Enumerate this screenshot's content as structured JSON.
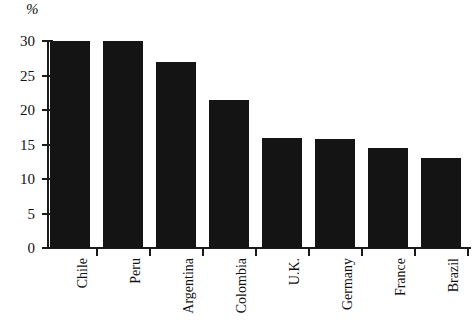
{
  "chart_data": {
    "type": "bar",
    "title": "",
    "subtitle": "",
    "xlabel": "",
    "ylabel": "%",
    "unit_label": "%",
    "categories": [
      "Chile",
      "Peru",
      "Argentina",
      "Colombia",
      "U.K.",
      "Germany",
      "France",
      "Brazil"
    ],
    "values": [
      30,
      30,
      27,
      21.5,
      16,
      15.8,
      14.5,
      13
    ],
    "series": [
      {
        "name": "",
        "values": [
          30,
          30,
          27,
          21.5,
          16,
          15.8,
          14.5,
          13
        ]
      }
    ],
    "ylim": [
      0,
      30
    ],
    "ytick_values": [
      0,
      5,
      10,
      15,
      20,
      25,
      30
    ],
    "ytick_labels": [
      "0",
      "5",
      "10",
      "15",
      "20",
      "25",
      "30"
    ],
    "grid": false,
    "legend": false,
    "legend_position": "none",
    "bar_color": "#141414",
    "axis_color": "#1a1a1a",
    "background_color": "#ffffff",
    "annotations": []
  },
  "axis": {
    "y_label_unit": "%",
    "ticks": [
      {
        "label": "30",
        "value": 30
      },
      {
        "label": "25",
        "value": 25
      },
      {
        "label": "20",
        "value": 20
      },
      {
        "label": "15",
        "value": 15
      },
      {
        "label": "10",
        "value": 10
      },
      {
        "label": "5",
        "value": 5
      },
      {
        "label": "0",
        "value": 0
      }
    ]
  }
}
